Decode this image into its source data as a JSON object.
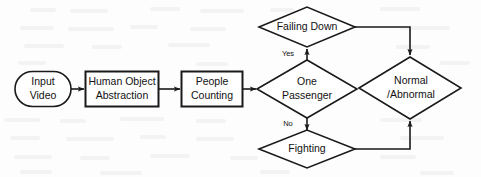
{
  "diagram": {
    "background_color": "#fdfdfd",
    "stroke_color": "#1a1a1a",
    "fill_color": "#ffffff",
    "nodes": [
      {
        "id": "input-video",
        "shape": "stadium",
        "label_line1": "Input",
        "label_line2": "Video",
        "cx": 43,
        "cy": 89,
        "w": 56,
        "h": 35
      },
      {
        "id": "human-object-abstraction",
        "shape": "rectangle",
        "label_line1": "Human Object",
        "label_line2": "Abstraction",
        "cx": 122,
        "cy": 89,
        "w": 73,
        "h": 35
      },
      {
        "id": "people-counting",
        "shape": "rectangle",
        "label_line1": "People",
        "label_line2": "Counting",
        "cx": 212,
        "cy": 89,
        "w": 61,
        "h": 35
      },
      {
        "id": "failing-down",
        "shape": "diamond",
        "label_line1": "Failing Down",
        "label_line2": "",
        "cx": 307,
        "cy": 27,
        "w": 96,
        "h": 40
      },
      {
        "id": "one-passenger",
        "shape": "diamond",
        "label_line1": "One",
        "label_line2": "Passenger",
        "cx": 307,
        "cy": 89,
        "w": 100,
        "h": 58
      },
      {
        "id": "fighting",
        "shape": "diamond",
        "label_line1": "Fighting",
        "label_line2": "",
        "cx": 307,
        "cy": 149,
        "w": 96,
        "h": 40
      },
      {
        "id": "normal-abnormal",
        "shape": "diamond",
        "label_line1": "Normal",
        "label_line2": "/Abnormal",
        "cx": 410,
        "cy": 88,
        "w": 102,
        "h": 62
      }
    ],
    "edges": [
      {
        "id": "edge-input-to-abstraction",
        "from": "input-video",
        "to": "human-object-abstraction",
        "label": ""
      },
      {
        "id": "edge-abstraction-to-counting",
        "from": "human-object-abstraction",
        "to": "people-counting",
        "label": ""
      },
      {
        "id": "edge-counting-to-one-passenger",
        "from": "people-counting",
        "to": "one-passenger",
        "label": ""
      },
      {
        "id": "edge-one-passenger-to-failing-down",
        "from": "one-passenger",
        "to": "failing-down",
        "label": "Yes"
      },
      {
        "id": "edge-one-passenger-to-fighting",
        "from": "one-passenger",
        "to": "fighting",
        "label": "No"
      },
      {
        "id": "edge-failing-down-to-normal-abnormal",
        "from": "failing-down",
        "to": "normal-abnormal",
        "label": ""
      },
      {
        "id": "edge-fighting-to-normal-abnormal",
        "from": "fighting",
        "to": "normal-abnormal",
        "label": ""
      }
    ],
    "edge_labels": {
      "yes": "Yes",
      "no": "No"
    }
  }
}
